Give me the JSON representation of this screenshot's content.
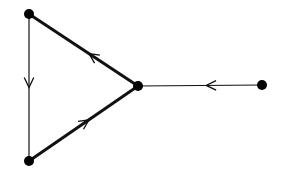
{
  "diagram": {
    "type": "directed-graph",
    "nodes": [
      {
        "id": "A",
        "x": 29,
        "y": 14,
        "label": ""
      },
      {
        "id": "B",
        "x": 29,
        "y": 161,
        "label": ""
      },
      {
        "id": "C",
        "x": 138,
        "y": 86,
        "label": ""
      },
      {
        "id": "D",
        "x": 262,
        "y": 85,
        "label": ""
      }
    ],
    "edges": [
      {
        "from": "A",
        "to": "B",
        "style": "thin",
        "arrow_at": 0.5
      },
      {
        "from": "B",
        "to": "C",
        "style": "thick",
        "arrow_at": 0.55
      },
      {
        "from": "C",
        "to": "A",
        "style": "thick",
        "arrow_at": 0.45
      },
      {
        "from": "D",
        "to": "C",
        "style": "thin",
        "arrow_at": 0.45
      }
    ],
    "colors": {
      "stroke": "#111111",
      "node": "#000000",
      "background": "#ffffff"
    }
  }
}
